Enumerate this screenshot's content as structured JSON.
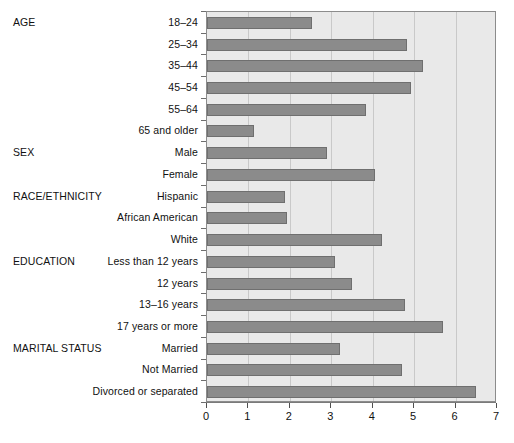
{
  "chart_data": {
    "type": "bar",
    "orientation": "horizontal",
    "title": "",
    "xlabel": "",
    "ylabel": "",
    "xlim": [
      0,
      7
    ],
    "xticks": [
      "0",
      "1",
      "2",
      "3",
      "4",
      "5",
      "6",
      "7"
    ],
    "grid": true,
    "legend": null,
    "bar_color": "#8b8b8b",
    "plot_background": "#e9e9e9",
    "groups": [
      {
        "name": "AGE",
        "categories": [
          "18–24",
          "25–34",
          "35–44",
          "45–54",
          "55–64",
          "65 and older"
        ],
        "values": [
          2.54,
          4.83,
          5.22,
          4.93,
          3.84,
          1.13
        ]
      },
      {
        "name": "SEX",
        "categories": [
          "Male",
          "Female"
        ],
        "values": [
          2.89,
          4.06
        ]
      },
      {
        "name": "RACE/ETHNICITY",
        "categories": [
          "Hispanic",
          "African American",
          "White"
        ],
        "values": [
          1.88,
          1.92,
          4.22
        ]
      },
      {
        "name": "EDUCATION",
        "categories": [
          "Less than 12 years",
          "12 years",
          "13–16 years",
          "17 years or more"
        ],
        "values": [
          3.09,
          3.5,
          4.78,
          5.7
        ]
      },
      {
        "name": "MARITAL STATUS",
        "categories": [
          "Married",
          "Not Married",
          "Divorced or separated"
        ],
        "values": [
          3.21,
          4.71,
          6.5
        ]
      }
    ],
    "categories": [
      "18–24",
      "25–34",
      "35–44",
      "45–54",
      "55–64",
      "65 and older",
      "Male",
      "Female",
      "Hispanic",
      "African American",
      "White",
      "Less than 12 years",
      "12 years",
      "13–16 years",
      "17 years or more",
      "Married",
      "Not Married",
      "Divorced or separated"
    ],
    "values": [
      2.54,
      4.83,
      5.22,
      4.93,
      3.84,
      1.13,
      2.89,
      4.06,
      1.88,
      1.92,
      4.22,
      3.09,
      3.5,
      4.78,
      5.7,
      3.21,
      4.71,
      6.5
    ]
  }
}
